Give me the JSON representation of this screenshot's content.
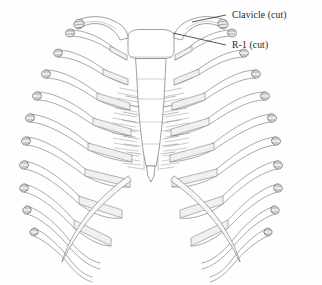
{
  "figure": {
    "view": "anterior",
    "style": "line-drawing",
    "background_color": "#fefefe",
    "line_color": "#6e6e72",
    "label_color": "#1e1e20",
    "cartilage_color": "#f0f0f1"
  },
  "labels": [
    {
      "id": "clavicle",
      "text": "Clavicle (cut)",
      "x": 228,
      "y": 18,
      "leader_from_x": 226,
      "leader_from_y": 15,
      "leader_to_x": 192,
      "leader_to_y": 22
    },
    {
      "id": "rib-1",
      "text": "R-1 (cut)",
      "x": 228,
      "y": 48,
      "leader_from_x": 226,
      "leader_from_y": 45,
      "leader_to_x": 173,
      "leader_to_y": 33
    }
  ],
  "structures": {
    "sternum": {
      "name": "sternum",
      "parts": [
        "manubrium",
        "body",
        "xiphoid-process"
      ]
    },
    "clavicles": {
      "name": "clavicle",
      "count": 2,
      "state": "cut",
      "sides": [
        "left",
        "right"
      ]
    },
    "ribs": {
      "name": "rib",
      "pairs": 10,
      "state": "cut",
      "numbering": [
        "R-1",
        "R-2",
        "R-3",
        "R-4",
        "R-5",
        "R-6",
        "R-7",
        "R-8",
        "R-9",
        "R-10"
      ]
    },
    "costal_cartilages": {
      "name": "costal-cartilage",
      "count": 14
    },
    "vertebral_shading": {
      "name": "vertebral-column-shading",
      "description": "hatched shading of thoracic vertebrae seen through thorax"
    }
  }
}
